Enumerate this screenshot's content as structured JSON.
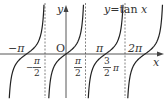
{
  "chart_data": {
    "type": "line",
    "function": "tan",
    "xlabel": "x",
    "ylabel": "y",
    "origin_label": "O",
    "x_ticks": [
      {
        "value": -3.14159,
        "label": "-π"
      },
      {
        "value": -1.5708,
        "label": "-π/2"
      },
      {
        "value": 0,
        "label": "O"
      },
      {
        "value": 1.5708,
        "label": "π/2"
      },
      {
        "value": 3.14159,
        "label": "π"
      },
      {
        "value": 4.7124,
        "label": "3/2 π"
      },
      {
        "value": 6.28318,
        "label": "2π"
      }
    ],
    "asymptotes": [
      -1.5708,
      1.5708,
      4.7124
    ],
    "zeros": [
      -3.14159,
      0,
      3.14159,
      6.28318
    ],
    "xlim": [
      -4.2,
      7.2
    ],
    "grid": false,
    "legend": null
  },
  "labels": {
    "equation_lhs": "y",
    "equation_eq": "=",
    "equation_rhs": "tan ",
    "equation_var": "x",
    "y_axis": "y",
    "x_axis": "x",
    "origin": "O",
    "neg_pi": "−π",
    "pi": "π",
    "two_pi": "2π",
    "neg_half_pi_sign": "−",
    "half_pi_num": "π",
    "half_pi_den": "2",
    "three_half_num": "3",
    "three_half_den": "2",
    "three_half_pi": "π"
  },
  "colors": {
    "curve": "#222222",
    "axis": "#444444",
    "asymptote": "#666666",
    "text": "#333333"
  }
}
